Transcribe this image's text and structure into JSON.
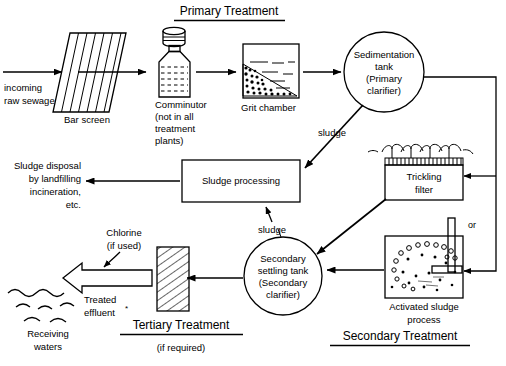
{
  "diagram": {
    "headings": {
      "primary": "Primary Treatment",
      "secondary": "Secondary Treatment",
      "tertiary": "Tertiary Treatment",
      "tertiary_note": "(if required)"
    },
    "nodes": {
      "inflow": {
        "line1": "incoming",
        "line2": "raw sewage"
      },
      "bar_screen": {
        "label": "Bar screen"
      },
      "comminutor": {
        "line1": "Comminutor",
        "line2": "(not in all",
        "line3": "treatment",
        "line4": "plants)"
      },
      "grit_chamber": {
        "label": "Grit chamber"
      },
      "sedimentation_tank": {
        "line1": "Sedimentation",
        "line2": "tank",
        "line3": "(Primary",
        "line4": "clarifier)"
      },
      "trickling_filter": {
        "line1": "Trickling",
        "line2": "filter"
      },
      "activated_sludge": {
        "line1": "Activated sludge",
        "line2": "process"
      },
      "or_connector": {
        "label": "or"
      },
      "secondary_settling_tank": {
        "line1": "Secondary",
        "line2": "settling tank",
        "line3": "(Secondary",
        "line4": "clarifier)"
      },
      "sludge_processing": {
        "label": "Sludge processing"
      },
      "sludge_disposal": {
        "line1": "Sludge disposal",
        "line2": "by landfilling",
        "line3": "incineration,",
        "line4": "etc."
      },
      "chlorine": {
        "line1": "Chlorine",
        "line2": "(if used)"
      },
      "treated_effluent": {
        "line1": "Treated",
        "line2": "effluent"
      },
      "receiving_waters": {
        "line1": "Receiving",
        "line2": "waters"
      }
    },
    "edge_labels": {
      "sludge_primary": "sludge",
      "sludge_secondary": "sludge"
    },
    "colors": {
      "line": "#000000",
      "background": "#ffffff",
      "text": "#000000"
    }
  }
}
